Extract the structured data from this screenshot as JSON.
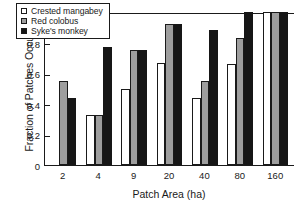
{
  "chart_data": {
    "type": "bar",
    "title": "",
    "xlabel": "Patch Area (ha)",
    "ylabel": "Fraction of Patches Occupied",
    "categories": [
      "2",
      "4",
      "9",
      "20",
      "40",
      "80",
      "160"
    ],
    "series": [
      {
        "name": "Crested mangabey",
        "color": "#ffffff",
        "values": [
          0,
          0.33,
          0.5,
          0.67,
          0.44,
          0.66,
          1.0
        ]
      },
      {
        "name": "Red colobus",
        "color": "#9e9e9e",
        "values": [
          0.55,
          0.33,
          0.75,
          0.92,
          0.55,
          0.83,
          1.0
        ]
      },
      {
        "name": "Syke's monkey",
        "color": "#161616",
        "values": [
          0.44,
          0.77,
          0.75,
          0.92,
          0.88,
          1.0,
          1.0
        ]
      }
    ],
    "ylim": [
      0,
      1
    ],
    "yticks": [
      "0",
      "0.2",
      "0.4",
      "0.6",
      "0.8",
      "1"
    ],
    "ytick_values": [
      0,
      0.2,
      0.4,
      0.6,
      0.8,
      1
    ],
    "grid": false,
    "legend_position": "upper-left-inside"
  }
}
